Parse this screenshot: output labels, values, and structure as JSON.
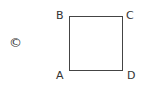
{
  "option_label": "©",
  "figure": {
    "shape": "square",
    "vertices": {
      "top_left": "B",
      "top_right": "C",
      "bottom_left": "A",
      "bottom_right": "D"
    }
  }
}
